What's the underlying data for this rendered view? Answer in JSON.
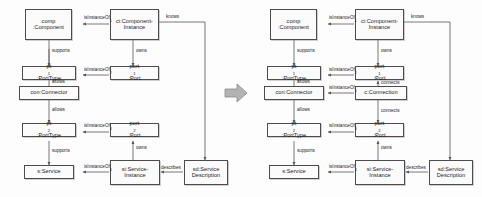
{
  "figure": {
    "transition_arrow": "right-block-arrow",
    "colors": {
      "background": "#fdfdfd",
      "node_fill": "#fbfbfb",
      "node_stroke": "#4c4c4c",
      "edge_stroke": "#555555",
      "text": "#1a1a1a",
      "transition_arrow_fill": "#b3b3b3",
      "transition_arrow_stroke": "#8c8c8c"
    }
  },
  "diagrams": [
    {
      "id": "left",
      "name": "component-service-model-before",
      "nodes": {
        "comp": {
          "line1": "comp",
          "line2": ":Component"
        },
        "ci": {
          "line1": "ci:Component-",
          "line2": "Instance"
        },
        "pt1": {
          "name": "pt",
          "sub": "1",
          "rest": ":PortType"
        },
        "port1": {
          "name": "port",
          "sub": "1",
          "rest": ":Port"
        },
        "con": {
          "line1": "con:Connector"
        },
        "pt2": {
          "name": "pt",
          "sub": "2",
          "rest": ":PortType"
        },
        "port2": {
          "name": "port",
          "sub": "2",
          "rest": ":Port"
        },
        "s": {
          "line1": "s:Service"
        },
        "si": {
          "line1": "si:Service-",
          "line2": "Instance"
        },
        "sd": {
          "line1": "sd:Service",
          "line2": "Description"
        }
      },
      "edges": {
        "ci_comp": {
          "name": "isInstanceOf",
          "sub": "1"
        },
        "comp_pt1": {
          "name": "supports"
        },
        "ci_port1": {
          "name": "owns"
        },
        "port1_pt1": {
          "name": "isInstanceOf",
          "sub": "2"
        },
        "pt1_con": {
          "name": "allows"
        },
        "con_pt2": {
          "name": "allows"
        },
        "port2_pt2": {
          "name": "isInstanceOf",
          "sub": "3"
        },
        "pt2_s": {
          "name": "supports"
        },
        "si_port2": {
          "name": "owns"
        },
        "si_s": {
          "name": "isInstanceOf",
          "sub": "4"
        },
        "sd_si": {
          "name": "describes"
        },
        "ci_sd": {
          "name": "knows"
        }
      }
    },
    {
      "id": "right",
      "name": "component-service-model-after",
      "nodes": {
        "comp": {
          "line1": "comp",
          "line2": ":Component"
        },
        "ci": {
          "line1": "ci:Component-",
          "line2": "Instance"
        },
        "pt1": {
          "name": "pt",
          "sub": "1",
          "rest": ":PortType"
        },
        "port1": {
          "name": "port",
          "sub": "1",
          "rest": ":Port"
        },
        "con": {
          "line1": "con:Connector"
        },
        "conn": {
          "line1": "c:Connection"
        },
        "pt2": {
          "name": "pt",
          "sub": "2",
          "rest": ":PortType"
        },
        "port2": {
          "name": "port",
          "sub": "2",
          "rest": ":Port"
        },
        "s": {
          "line1": "s:Service"
        },
        "si": {
          "line1": "si:Service-",
          "line2": "Instance"
        },
        "sd": {
          "line1": "sd:Service",
          "line2": "Description"
        }
      },
      "edges": {
        "ci_comp": {
          "name": "isInstanceOf",
          "sub": "1"
        },
        "comp_pt1": {
          "name": "supports"
        },
        "ci_port1": {
          "name": "owns"
        },
        "port1_pt1": {
          "name": "isInstanceOf",
          "sub": "2"
        },
        "pt1_con": {
          "name": "allows"
        },
        "port1_conn": {
          "name": "connects"
        },
        "conn_con": {
          "name": "isInstanceOf",
          "sub": "5"
        },
        "conn_port2": {
          "name": "connects"
        },
        "con_pt2": {
          "name": "allows"
        },
        "port2_pt2": {
          "name": "isInstanceOf",
          "sub": "3"
        },
        "pt2_s": {
          "name": "supports"
        },
        "si_port2": {
          "name": "owns"
        },
        "si_s": {
          "name": "isInstanceOf",
          "sub": "4"
        },
        "sd_si": {
          "name": "describes"
        },
        "ci_sd": {
          "name": "knows"
        }
      }
    }
  ]
}
